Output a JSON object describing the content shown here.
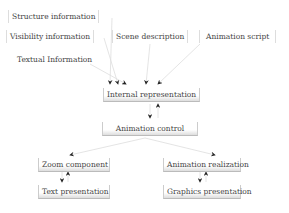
{
  "inputs": {
    "structure": "Structure information",
    "visibility": "Visibility information",
    "textual": "Textual Information",
    "scene": "Scene description",
    "animation_script": "Animation script"
  },
  "core": {
    "internal": "Internal representation",
    "control": "Animation control"
  },
  "outputs": {
    "zoom": "Zoom component",
    "text_presentation": "Text presentation",
    "realization": "Animation realization",
    "graphics_presentation": "Graphics presentation"
  }
}
